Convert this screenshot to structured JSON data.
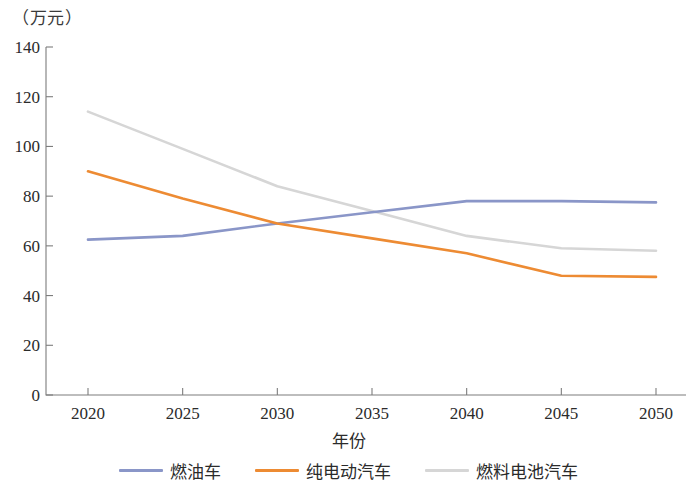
{
  "chart_data": {
    "type": "line",
    "title": "",
    "subtitle": "",
    "xlabel": "年份",
    "ylabel": "",
    "y_unit_caption": "（万元）",
    "x": [
      "2020",
      "2025",
      "2030",
      "2035",
      "2040",
      "2045",
      "2050"
    ],
    "categories": [
      "2020",
      "2025",
      "2030",
      "2035",
      "2040",
      "2045",
      "2050"
    ],
    "xlim": [
      2020,
      2050
    ],
    "ylim": [
      0,
      140
    ],
    "y_ticks": [
      "0",
      "20",
      "40",
      "60",
      "80",
      "100",
      "120",
      "140"
    ],
    "y_tick_values": [
      0,
      20,
      40,
      60,
      80,
      100,
      120,
      140
    ],
    "grid": false,
    "legend_position": "bottom",
    "series": [
      {
        "name": "燃油车",
        "color": "#8a96c8",
        "values": [
          62.5,
          64.0,
          69.0,
          73.5,
          78.0,
          78.0,
          77.5
        ]
      },
      {
        "name": "纯电动汽车",
        "color": "#ed8b33",
        "values": [
          90.0,
          79.0,
          69.0,
          63.0,
          57.0,
          48.0,
          47.5
        ]
      },
      {
        "name": "燃料电池汽车",
        "color": "#d6d6d6",
        "values": [
          114.0,
          99.0,
          84.0,
          74.0,
          64.0,
          59.0,
          58.0
        ]
      }
    ]
  },
  "legend": {
    "items": [
      {
        "label": "燃油车",
        "color": "#8a96c8"
      },
      {
        "label": "纯电动汽车",
        "color": "#ed8b33"
      },
      {
        "label": "燃料电池汽车",
        "color": "#d6d6d6"
      }
    ]
  },
  "axes": {
    "x_title": "年份",
    "y_unit": "（万元）"
  }
}
